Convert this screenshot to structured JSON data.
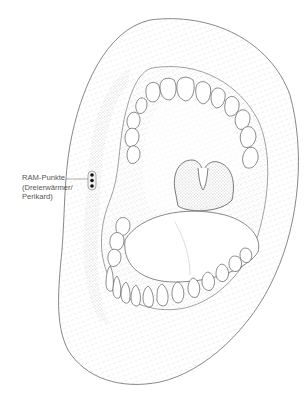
{
  "figure": {
    "annotation": {
      "lines": [
        "RAM-Punkte",
        "(Dreierwärmer/",
        "Perikard)"
      ],
      "marker_points": 3
    },
    "colors": {
      "line": "#6a6a6a",
      "stipple": "#9a9a9a",
      "point": "#111111",
      "text": "#555555"
    }
  }
}
